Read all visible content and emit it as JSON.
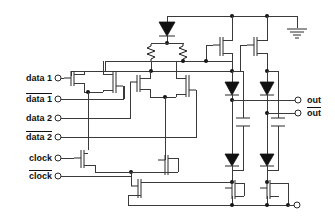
{
  "diagram": {
    "type": "transistor-level-schematic",
    "canvas": {
      "width": 335,
      "height": 223,
      "background": "#ffffff"
    },
    "line_color": "#3a3a3a",
    "device_color": "#2a2a2a"
  },
  "inputs": [
    {
      "id": "data1",
      "label": "data 1",
      "overbar": false,
      "terminal_x": 57,
      "terminal_y": 78,
      "label_x": 8,
      "label_y": 73
    },
    {
      "id": "data1_bar",
      "label": "data 1",
      "overbar": true,
      "terminal_x": 57,
      "terminal_y": 99,
      "label_x": 8,
      "label_y": 94
    },
    {
      "id": "data2",
      "label": "data 2",
      "overbar": false,
      "terminal_x": 57,
      "terminal_y": 118,
      "label_x": 8,
      "label_y": 113
    },
    {
      "id": "data2_bar",
      "label": "data 2",
      "overbar": true,
      "terminal_x": 57,
      "terminal_y": 137,
      "label_x": 8,
      "label_y": 132
    },
    {
      "id": "clock",
      "label": "clock",
      "overbar": false,
      "terminal_x": 57,
      "terminal_y": 158,
      "label_x": 16,
      "label_y": 153
    },
    {
      "id": "clock_bar",
      "label": "clock",
      "overbar": true,
      "terminal_x": 57,
      "terminal_y": 176,
      "label_x": 16,
      "label_y": 171
    }
  ],
  "outputs": [
    {
      "id": "out",
      "label": "out",
      "overbar": false,
      "terminal_x": 299,
      "terminal_y": 100,
      "label_x": 308,
      "label_y": 95
    },
    {
      "id": "out_bar",
      "label": "out",
      "overbar": true,
      "terminal_x": 299,
      "terminal_y": 113,
      "label_x": 308,
      "label_y": 108
    }
  ],
  "nodes": [
    {
      "id": "ground",
      "name": "ground-symbol",
      "x": 297,
      "y": 16
    },
    {
      "id": "bias_terminal",
      "name": "bias-terminal",
      "x": 297,
      "y": 211
    }
  ],
  "components": {
    "diodes": [
      {
        "id": "d-top",
        "name": "top-clamp-diode",
        "x": 167,
        "y": 25
      },
      {
        "id": "d-ul",
        "name": "upper-left-load-diode",
        "x": 232,
        "y": 85
      },
      {
        "id": "d-ur",
        "name": "upper-right-load-diode",
        "x": 267,
        "y": 85
      },
      {
        "id": "d-ll",
        "name": "lower-left-load-diode",
        "x": 232,
        "y": 157
      },
      {
        "id": "d-lr",
        "name": "lower-right-load-diode",
        "x": 267,
        "y": 157
      }
    ],
    "resistors": [
      {
        "id": "r-left",
        "name": "left-load-resistor",
        "x": 151,
        "y": 48
      },
      {
        "id": "r-right",
        "name": "right-load-resistor",
        "x": 181,
        "y": 48
      }
    ],
    "capacitors": [
      {
        "id": "c-left",
        "name": "left-output-capacitor",
        "x": 243,
        "y": 122
      },
      {
        "id": "c-right",
        "name": "right-output-capacitor",
        "x": 278,
        "y": 122
      }
    ],
    "transistors": [
      {
        "id": "q-data1",
        "name": "data1-input-transistor"
      },
      {
        "id": "q-data1b",
        "name": "data1-bar-input-transistor"
      },
      {
        "id": "q-data2",
        "name": "data2-input-transistor"
      },
      {
        "id": "q-data2b",
        "name": "data2-bar-input-transistor"
      },
      {
        "id": "q-clock",
        "name": "clock-tail-transistor"
      },
      {
        "id": "q-clockb",
        "name": "clock-bar-tail-transistor"
      },
      {
        "id": "q-bias",
        "name": "bias-current-transistor"
      },
      {
        "id": "q-buf-l",
        "name": "left-buffer-transistor"
      },
      {
        "id": "q-buf-r",
        "name": "right-buffer-transistor"
      },
      {
        "id": "q-src-l",
        "name": "left-current-source-transistor"
      },
      {
        "id": "q-src-r",
        "name": "right-current-source-transistor"
      }
    ]
  }
}
